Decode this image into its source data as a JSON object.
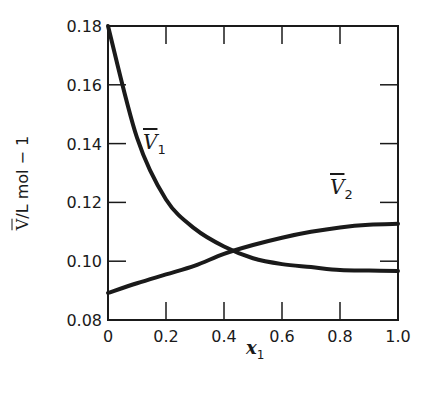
{
  "chart_data": {
    "type": "line",
    "title": "",
    "xlabel": "x1",
    "ylabel": "V̄/L mol − 1",
    "xlim": [
      0,
      1.0
    ],
    "ylim": [
      0.08,
      0.18
    ],
    "xticks": [
      "0",
      "0.2",
      "0.4",
      "0.6",
      "0.8",
      "1.0"
    ],
    "yticks": [
      "0.08",
      "0.10",
      "0.12",
      "0.14",
      "0.16",
      "0.18"
    ],
    "grid": false,
    "legend": "none (inline curve labels)",
    "x": [
      0.0,
      0.1,
      0.2,
      0.3,
      0.4,
      0.5,
      0.6,
      0.7,
      0.8,
      0.9,
      1.0
    ],
    "series": [
      {
        "name": "V̄1",
        "label_position": [
          0.14,
          0.138
        ],
        "values": [
          0.18,
          0.142,
          0.121,
          0.111,
          0.105,
          0.101,
          0.099,
          0.098,
          0.097,
          0.0968,
          0.0967
        ]
      },
      {
        "name": "V̄2",
        "label_position": [
          0.8,
          0.118
        ],
        "values": [
          0.0892,
          0.0925,
          0.0955,
          0.0985,
          0.1025,
          0.1055,
          0.108,
          0.11,
          0.1115,
          0.1124,
          0.1127
        ]
      }
    ],
    "annotations": [
      "curves intersect near x1 ≈ 0.43, V̄ ≈ 0.104"
    ]
  },
  "labels": {
    "ylabel_v": "V",
    "ylabel_rest": "/L mol − 1",
    "xlabel_var": "x",
    "xlabel_sub": "1",
    "curve1_v": "V",
    "curve1_sub": "1",
    "curve2_v": "V",
    "curve2_sub": "2"
  }
}
